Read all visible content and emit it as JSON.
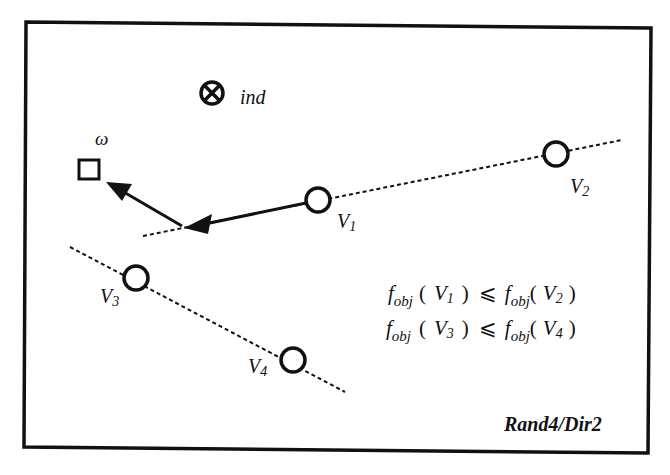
{
  "diagram": {
    "title_label": "Rand4/Dir2",
    "individual": {
      "symbol": "⊗",
      "label": "ind"
    },
    "target": {
      "symbol": "□",
      "label": "ω"
    },
    "points": [
      {
        "id": "V1",
        "base": "V",
        "sub": "1"
      },
      {
        "id": "V2",
        "base": "V",
        "sub": "2"
      },
      {
        "id": "V3",
        "base": "V",
        "sub": "3"
      },
      {
        "id": "V4",
        "base": "V",
        "sub": "4"
      }
    ],
    "formulas": [
      {
        "lhs_f": "f",
        "lhs_sub": "obj",
        "lhs_arg_base": "V",
        "lhs_arg_sub": "1",
        "op": "⩽",
        "rhs_f": "f",
        "rhs_sub": "obj",
        "rhs_arg_base": "V",
        "rhs_arg_sub": "2"
      },
      {
        "lhs_f": "f",
        "lhs_sub": "obj",
        "lhs_arg_base": "V",
        "lhs_arg_sub": "3",
        "op": "⩽",
        "rhs_f": "f",
        "rhs_sub": "obj",
        "rhs_arg_base": "V",
        "rhs_arg_sub": "4"
      }
    ],
    "paren_open": "(",
    "paren_close": ")",
    "colors": {
      "stroke": "#111111",
      "background": "#ffffff"
    }
  }
}
